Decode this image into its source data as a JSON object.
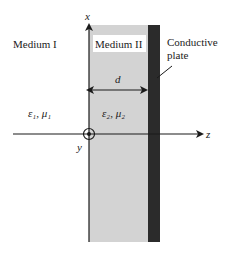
{
  "diagram": {
    "axes": {
      "x_label": "x",
      "z_label": "z",
      "y_label": "y"
    },
    "medium1": {
      "name": "Medium I",
      "params": "ε₁, μ₁"
    },
    "medium2": {
      "name": "Medium II",
      "params": "ε₂, μ₂",
      "thickness_label": "d"
    },
    "plate": {
      "label_line1": "Conductive",
      "label_line2": "plate"
    },
    "colors": {
      "medium2_fill": "#d3d3d3",
      "plate_fill": "#2b2b2b",
      "axis": "#1a1a1a"
    }
  }
}
